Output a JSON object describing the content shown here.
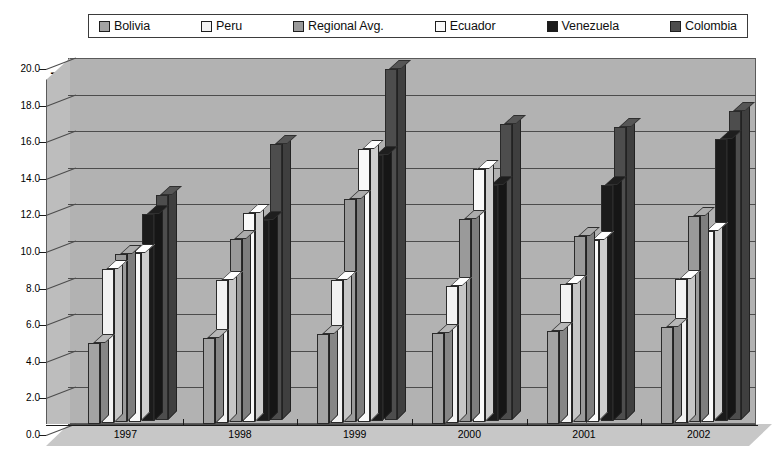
{
  "chart_data": {
    "type": "bar",
    "title": "",
    "xlabel": "",
    "ylabel": "Percent of Economically Active Population that is Unemployed",
    "ylim": [
      0.0,
      20.0
    ],
    "ytick_step": 2.0,
    "ytick_labels": [
      "20.0",
      "18.0",
      "16.0",
      "14.0",
      "12.0",
      "10.0",
      "8.0",
      "6.0",
      "4.0",
      "2.0",
      "0.0"
    ],
    "grid": true,
    "legend_position": "top",
    "categories": [
      "1997",
      "1998",
      "1999",
      "2000",
      "2001",
      "2002"
    ],
    "series": [
      {
        "name": "Bolivia",
        "color": "#a3a3a3",
        "values": [
          4.4,
          4.7,
          4.9,
          5.0,
          5.1,
          5.3
        ]
      },
      {
        "name": "Peru",
        "color": "#f2f2f2",
        "values": [
          8.4,
          7.8,
          7.8,
          7.5,
          7.6,
          7.9
        ]
      },
      {
        "name": "Regional Avg.",
        "color": "#9a9a9a",
        "values": [
          9.2,
          10.0,
          12.2,
          11.1,
          10.2,
          11.3
        ]
      },
      {
        "name": "Ecuador",
        "color": "#fafafa",
        "values": [
          9.2,
          11.4,
          14.9,
          13.8,
          9.9,
          10.4
        ]
      },
      {
        "name": "Venezuela",
        "color": "#1b1b1b",
        "values": [
          11.3,
          11.0,
          14.5,
          12.9,
          12.9,
          15.4
        ]
      },
      {
        "name": "Colombia",
        "color": "#4d4d4d",
        "values": [
          12.3,
          15.1,
          19.2,
          16.2,
          16.0,
          16.9
        ]
      }
    ]
  },
  "legend": {
    "items": [
      {
        "label": "Bolivia"
      },
      {
        "label": "Peru"
      },
      {
        "label": "Regional Avg."
      },
      {
        "label": "Ecuador"
      },
      {
        "label": "Venezuela"
      },
      {
        "label": "Colombia"
      }
    ]
  },
  "axes": {
    "y_title": "Percent of Economically Active Population that is Unemployed"
  },
  "colors": {
    "plot_background": "#b2b2b2",
    "gridline": "#4c4c4c",
    "axis": "#1b1b1b",
    "page_background": "#ffffff"
  }
}
